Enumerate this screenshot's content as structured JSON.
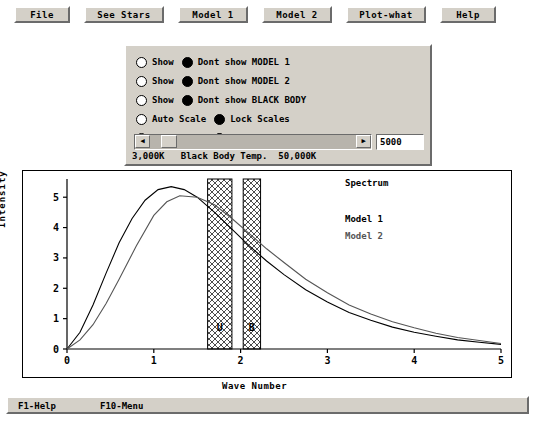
{
  "menu": {
    "items": [
      {
        "label": "File",
        "x": 14,
        "w": 56
      },
      {
        "label": "See Stars",
        "x": 84,
        "w": 80
      },
      {
        "label": "Model 1",
        "x": 178,
        "w": 70
      },
      {
        "label": "Model 2",
        "x": 262,
        "w": 70
      },
      {
        "label": "Plot-what",
        "x": 346,
        "w": 80
      },
      {
        "label": "Help",
        "x": 440,
        "w": 56
      }
    ]
  },
  "panel": {
    "rows": [
      {
        "y": 8,
        "left_selected": false,
        "left_label": "Show",
        "right_selected": true,
        "right_label": "Dont show MODEL 1"
      },
      {
        "y": 27,
        "left_selected": false,
        "left_label": "Show",
        "right_selected": true,
        "right_label": "Dont show MODEL 2"
      },
      {
        "y": 46,
        "left_selected": false,
        "left_label": "Show",
        "right_selected": true,
        "right_label": "Dont show BLACK BODY"
      },
      {
        "y": 65,
        "left_selected": false,
        "left_label": "Auto Scale",
        "right_selected": true,
        "right_label": "Lock Scales"
      },
      {
        "y": 84,
        "left_selected": false,
        "left_label": "Auto Clear",
        "right_selected": true,
        "right_label": "Keep Graphs"
      }
    ],
    "slider": {
      "left_arrow": "◀",
      "right_arrow": "▶",
      "value": "5000"
    },
    "temp_line": "3,000K   Black Body Temp.  50,000K"
  },
  "plot": {
    "title": "Spectrum",
    "legend": [
      {
        "label": "Model 1",
        "color": "#000000"
      },
      {
        "label": "Model 2",
        "color": "#555555"
      }
    ],
    "band_labels": [
      {
        "label": "U",
        "x": 1.76
      },
      {
        "label": "B",
        "x": 2.13
      }
    ]
  },
  "status": {
    "left": "F1-Help",
    "right": "F10-Menu"
  },
  "chart_data": {
    "type": "line",
    "title": "Spectrum",
    "xlabel": "Wave Number",
    "ylabel": "Intensity",
    "xlim": [
      0,
      5
    ],
    "ylim": [
      0,
      5.6
    ],
    "xticks": [
      0,
      1,
      2,
      3,
      4,
      5
    ],
    "yticks": [
      0,
      1,
      2,
      3,
      4,
      5
    ],
    "grid": false,
    "legend_position": "upper-right-inside",
    "shaded_bands": [
      {
        "label": "U",
        "x0": 1.62,
        "x1": 1.9
      },
      {
        "label": "B",
        "x0": 2.03,
        "x1": 2.23
      }
    ],
    "series": [
      {
        "name": "Model 1",
        "color": "#000000",
        "x": [
          0.0,
          0.15,
          0.3,
          0.45,
          0.6,
          0.75,
          0.9,
          1.05,
          1.2,
          1.35,
          1.5,
          1.7,
          1.9,
          2.1,
          2.3,
          2.5,
          2.75,
          3.0,
          3.25,
          3.5,
          3.75,
          4.0,
          4.25,
          4.5,
          4.75,
          5.0
        ],
        "y": [
          0.0,
          0.55,
          1.45,
          2.5,
          3.5,
          4.3,
          4.9,
          5.25,
          5.35,
          5.25,
          5.0,
          4.5,
          3.95,
          3.4,
          2.9,
          2.45,
          1.95,
          1.55,
          1.2,
          0.95,
          0.72,
          0.55,
          0.42,
          0.3,
          0.22,
          0.15
        ]
      },
      {
        "name": "Model 2",
        "color": "#555555",
        "x": [
          0.0,
          0.15,
          0.3,
          0.45,
          0.6,
          0.8,
          1.0,
          1.15,
          1.3,
          1.5,
          1.7,
          1.9,
          2.1,
          2.3,
          2.5,
          2.75,
          3.0,
          3.25,
          3.5,
          3.75,
          4.0,
          4.25,
          4.5,
          4.75,
          5.0
        ],
        "y": [
          0.0,
          0.3,
          0.8,
          1.5,
          2.3,
          3.4,
          4.4,
          4.85,
          5.05,
          5.0,
          4.75,
          4.3,
          3.8,
          3.3,
          2.85,
          2.3,
          1.85,
          1.45,
          1.15,
          0.9,
          0.7,
          0.52,
          0.38,
          0.28,
          0.18
        ]
      }
    ]
  }
}
